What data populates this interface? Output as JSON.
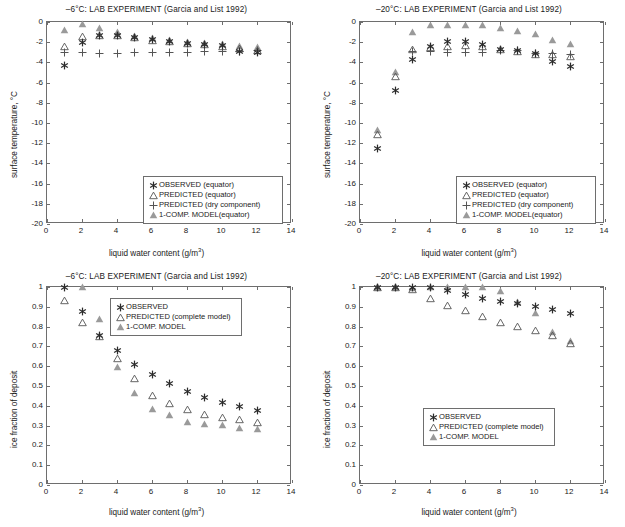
{
  "figure": {
    "panels": [
      "top-left",
      "top-right",
      "bottom-left",
      "bottom-right"
    ],
    "marker_colors": {
      "observed": "#2b2b2b",
      "predicted": "#555555",
      "dry_component": "#555555",
      "one_comp_model": "#9a9a9a",
      "axis": "#6e6e6e"
    }
  },
  "axis_titles": {
    "x": "liquid water content (g/m",
    "x_sup": "3",
    "x_end": ")",
    "y_temperature": "surface temperature, °C",
    "y_icefraction": "ice fraction of deposit"
  },
  "chart_data": [
    {
      "id": "temp-6",
      "type": "scatter",
      "title": "–6°C: LAB EXPERIMENT (Garcia and List 1992)",
      "xlabel": "liquid water content (g/m3)",
      "ylabel": "surface temperature, °C",
      "xlim": [
        0,
        14
      ],
      "ylim": [
        -20,
        0
      ],
      "xticks": [
        0,
        2,
        4,
        6,
        8,
        10,
        12,
        14
      ],
      "yticks": [
        0,
        -2,
        -4,
        -6,
        -8,
        -10,
        -12,
        -14,
        -16,
        -18,
        -20
      ],
      "xticklabels": [
        "0",
        "2",
        "4",
        "6",
        "8",
        "10",
        "12",
        "14"
      ],
      "yticklabels": [
        "0",
        "-2",
        "-4",
        "-6",
        "-8",
        "-10",
        "-12",
        "-14",
        "-16",
        "-18",
        "-20"
      ],
      "grid": false,
      "legend_position": "lower right",
      "series": [
        {
          "name": "OBSERVED (equator)",
          "marker": "star",
          "color": "#2b2b2b",
          "x": [
            1,
            2,
            3,
            4,
            5,
            6,
            7,
            8,
            9,
            10,
            11,
            12
          ],
          "values": [
            -4.3,
            -2.05,
            -1.3,
            -1.35,
            -1.5,
            -1.75,
            -1.9,
            -2.1,
            -2.25,
            -2.35,
            -2.9,
            -3.0
          ]
        },
        {
          "name": "PREDICTED (equator)",
          "marker": "triangle-open",
          "color": "#555555",
          "x": [
            1,
            2,
            3,
            4,
            5,
            6,
            7,
            8,
            9,
            10,
            11,
            12
          ],
          "values": [
            -2.35,
            -1.35,
            -1.25,
            -1.3,
            -1.5,
            -1.75,
            -1.9,
            -2.05,
            -2.2,
            -2.35,
            -2.6,
            -2.8
          ]
        },
        {
          "name": "PREDICTED (dry component)",
          "marker": "plus",
          "color": "#555555",
          "x": [
            1,
            2,
            3,
            4,
            5,
            6,
            7,
            8,
            9,
            10,
            11,
            12
          ],
          "values": [
            -3.0,
            -3.05,
            -3.1,
            -3.1,
            -3.05,
            -3.0,
            -3.0,
            -3.0,
            -2.95,
            -2.9,
            -2.9,
            -2.85
          ]
        },
        {
          "name": "1-COMP. MODEL(equator)",
          "marker": "triangle-filled",
          "color": "#9a9a9a",
          "x": [
            1,
            2,
            3,
            4,
            5,
            6,
            7,
            8,
            9,
            10,
            11,
            12
          ],
          "values": [
            -0.75,
            -0.2,
            -0.6,
            -1.0,
            -1.35,
            -1.6,
            -1.8,
            -1.95,
            -2.1,
            -2.2,
            -2.35,
            -2.45
          ]
        }
      ]
    },
    {
      "id": "temp-20",
      "type": "scatter",
      "title": "–20°C: LAB EXPERIMENT (Garcia and List 1992)",
      "xlabel": "liquid water content (g/m3)",
      "ylabel": "surface temperature, °C",
      "xlim": [
        0,
        14
      ],
      "ylim": [
        -20,
        0
      ],
      "xticks": [
        0,
        2,
        4,
        6,
        8,
        10,
        12,
        14
      ],
      "yticks": [
        0,
        -2,
        -4,
        -6,
        -8,
        -10,
        -12,
        -14,
        -16,
        -18,
        -20
      ],
      "xticklabels": [
        "0",
        "2",
        "4",
        "6",
        "8",
        "10",
        "12",
        "14"
      ],
      "yticklabels": [
        "0",
        "-2",
        "-4",
        "-6",
        "-8",
        "-10",
        "-12",
        "-14",
        "-16",
        "-18",
        "-20"
      ],
      "grid": false,
      "legend_position": "lower right",
      "series": [
        {
          "name": "OBSERVED (equator)",
          "marker": "star",
          "color": "#2b2b2b",
          "x": [
            1,
            2,
            3,
            4,
            5,
            6,
            7,
            8,
            9,
            10,
            11,
            12
          ],
          "values": [
            -12.55,
            -6.75,
            -3.75,
            -2.4,
            -1.95,
            -1.9,
            -2.2,
            -2.75,
            -2.85,
            -3.1,
            -3.95,
            -4.45
          ]
        },
        {
          "name": "PREDICTED (equator)",
          "marker": "triangle-open",
          "color": "#555555",
          "x": [
            1,
            2,
            3,
            4,
            5,
            6,
            7,
            8,
            9,
            10,
            11,
            12
          ],
          "values": [
            -11.1,
            -5.3,
            -2.65,
            -2.45,
            -2.35,
            -2.25,
            -2.4,
            -2.7,
            -2.9,
            -3.15,
            -3.2,
            -3.35
          ]
        },
        {
          "name": "PREDICTED (dry component)",
          "marker": "plus",
          "color": "#555555",
          "x": [
            3,
            4,
            5,
            6,
            7,
            8,
            9,
            10,
            11,
            12
          ],
          "values": [
            -2.95,
            -2.95,
            -3.0,
            -3.0,
            -3.0,
            -2.85,
            -2.85,
            -3.1,
            -3.15,
            -3.2
          ]
        },
        {
          "name": "1-COMP. MODEL(equator)",
          "marker": "triangle-filled",
          "color": "#9a9a9a",
          "x": [
            1,
            2,
            3,
            4,
            5,
            6,
            7,
            8,
            9,
            10,
            11,
            12
          ],
          "values": [
            -10.7,
            -4.95,
            -1.0,
            -0.25,
            -0.25,
            -0.25,
            -0.25,
            -0.55,
            -0.85,
            -1.15,
            -1.8,
            -2.2
          ]
        }
      ]
    },
    {
      "id": "ice-6",
      "type": "scatter",
      "title": "–6°C: LAB EXPERIMENT (Garcia and List 1992)",
      "xlabel": "liquid water content (g/m3)",
      "ylabel": "ice fraction of deposit",
      "xlim": [
        0,
        14
      ],
      "ylim": [
        0,
        1
      ],
      "xticks": [
        0,
        2,
        4,
        6,
        8,
        10,
        12,
        14
      ],
      "yticks": [
        0,
        0.1,
        0.2,
        0.3,
        0.4,
        0.5,
        0.6,
        0.7,
        0.8,
        0.9,
        1
      ],
      "xticklabels": [
        "0",
        "2",
        "4",
        "6",
        "8",
        "10",
        "12",
        "14"
      ],
      "yticklabels": [
        "0",
        "0.1",
        "0.2",
        "0.3",
        "0.4",
        "0.5",
        "0.6",
        "0.7",
        "0.8",
        "0.9",
        "1"
      ],
      "grid": false,
      "legend_position": "upper center",
      "series": [
        {
          "name": "OBSERVED",
          "marker": "star",
          "color": "#2b2b2b",
          "x": [
            1,
            2,
            3,
            4,
            5,
            6,
            7,
            8,
            9,
            10,
            11,
            12
          ],
          "values": [
            1.0,
            0.878,
            0.757,
            0.678,
            0.611,
            0.556,
            0.514,
            0.474,
            0.444,
            0.419,
            0.394,
            0.376
          ]
        },
        {
          "name": "PREDICTED (complete model)",
          "marker": "triangle-open",
          "color": "#555555",
          "x": [
            1,
            2,
            3,
            4,
            5,
            6,
            7,
            8,
            9,
            10,
            11,
            12
          ],
          "values": [
            0.936,
            0.822,
            0.752,
            0.641,
            0.539,
            0.457,
            0.412,
            0.383,
            0.358,
            0.345,
            0.331,
            0.319
          ]
        },
        {
          "name": "1-COMP. MODEL",
          "marker": "triangle-filled",
          "color": "#9a9a9a",
          "x": [
            2,
            3,
            4,
            5,
            6,
            7,
            8,
            9,
            10,
            11,
            12
          ],
          "values": [
            0.999,
            0.84,
            0.594,
            0.466,
            0.386,
            0.354,
            0.32,
            0.309,
            0.303,
            0.287,
            0.285
          ]
        }
      ]
    },
    {
      "id": "ice-20",
      "type": "scatter",
      "title": "–20°C: LAB EXPERIMENT (Garcia and List 1992)",
      "xlabel": "liquid water content (g/m3)",
      "ylabel": "ice fraction of deposit",
      "xlim": [
        0,
        14
      ],
      "ylim": [
        0,
        1
      ],
      "xticks": [
        0,
        2,
        4,
        6,
        8,
        10,
        12,
        14
      ],
      "yticks": [
        0,
        0.1,
        0.2,
        0.3,
        0.4,
        0.5,
        0.6,
        0.7,
        0.8,
        0.9,
        1
      ],
      "xticklabels": [
        "0",
        "2",
        "4",
        "6",
        "8",
        "10",
        "12",
        "14"
      ],
      "yticklabels": [
        "0",
        "0.1",
        "0.2",
        "0.3",
        "0.4",
        "0.5",
        "0.6",
        "0.7",
        "0.8",
        "0.9",
        "1"
      ],
      "grid": false,
      "legend_position": "center left",
      "series": [
        {
          "name": "OBSERVED",
          "marker": "star",
          "color": "#2b2b2b",
          "x": [
            1,
            2,
            3,
            4,
            5,
            6,
            7,
            8,
            9,
            10,
            11,
            12
          ],
          "values": [
            1.0,
            1.0,
            0.996,
            0.997,
            0.982,
            0.961,
            0.944,
            0.928,
            0.915,
            0.899,
            0.884,
            0.868
          ]
        },
        {
          "name": "PREDICTED (complete model)",
          "marker": "triangle-open",
          "color": "#555555",
          "x": [
            1,
            2,
            3,
            4,
            5,
            6,
            7,
            8,
            9,
            10,
            11,
            12
          ],
          "values": [
            1.0,
            0.999,
            0.988,
            0.946,
            0.911,
            0.886,
            0.856,
            0.825,
            0.805,
            0.781,
            0.76,
            0.719
          ]
        },
        {
          "name": "1-COMP. MODEL",
          "marker": "triangle-filled",
          "color": "#9a9a9a",
          "x": [
            1,
            2,
            3,
            4,
            5,
            6,
            7,
            8,
            9,
            10,
            11,
            12
          ],
          "values": [
            1.0,
            1.0,
            0.997,
            1.0,
            1.0,
            1.0,
            1.0,
            0.978,
            0.922,
            0.868,
            0.775,
            0.726
          ]
        }
      ]
    }
  ]
}
